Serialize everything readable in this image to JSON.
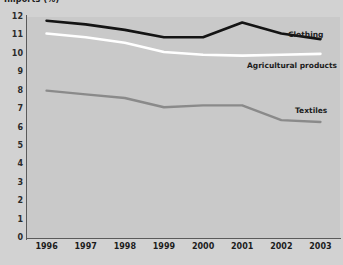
{
  "chart_data": {
    "type": "line",
    "title": "Imports (%)",
    "xlabel": "",
    "ylabel": "",
    "x": [
      "1996",
      "1997",
      "1998",
      "1999",
      "2000",
      "2001",
      "2002",
      "2003"
    ],
    "ylim": [
      0,
      12
    ],
    "yticks": [
      12,
      11,
      10,
      9,
      8,
      7,
      6,
      5,
      4,
      3,
      2,
      1,
      0
    ],
    "grid": false,
    "legend_position": "inline-right",
    "series": [
      {
        "name": "Clothing",
        "color": "#141414",
        "values": [
          11.8,
          11.6,
          11.3,
          10.9,
          10.9,
          11.7,
          11.1,
          10.8
        ]
      },
      {
        "name": "Agricultural products",
        "color": "#ffffff",
        "values": [
          11.1,
          10.9,
          10.6,
          10.1,
          9.95,
          9.9,
          9.95,
          10.0
        ]
      },
      {
        "name": "Textiles",
        "color": "#8a8a8a",
        "values": [
          8.0,
          7.8,
          7.6,
          7.1,
          7.2,
          7.2,
          6.4,
          6.3
        ]
      }
    ]
  },
  "colors": {
    "page_background": "#d2d2d2",
    "plot_background": "#c9c9c9",
    "axis": "#5a5a5a",
    "text": "#1c1c1c"
  }
}
